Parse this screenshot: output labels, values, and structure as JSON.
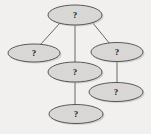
{
  "diagram": {
    "type": "node-link-graph",
    "title": "",
    "background_color": "#f2f1f0",
    "node_fill_color": "#d9d8d6",
    "node_stroke_color": "#4a4a4a",
    "edge_color": "#5a5a5a",
    "label_color": "#1d1d1d",
    "nodes": [
      {
        "id": "root",
        "label": "?",
        "cx": 75,
        "cy": 15,
        "rx": 27,
        "ry": 10
      },
      {
        "id": "left",
        "label": "?",
        "cx": 34,
        "cy": 53,
        "rx": 26,
        "ry": 9
      },
      {
        "id": "right",
        "label": "?",
        "cx": 117,
        "cy": 52,
        "rx": 26,
        "ry": 9.5
      },
      {
        "id": "middle",
        "label": "?",
        "cx": 75,
        "cy": 72,
        "rx": 27,
        "ry": 10
      },
      {
        "id": "lower-right",
        "label": "?",
        "cx": 116,
        "cy": 92,
        "rx": 27,
        "ry": 9.5
      },
      {
        "id": "bottom",
        "label": "?",
        "cx": 76,
        "cy": 114,
        "rx": 27,
        "ry": 9.5
      }
    ],
    "edges": [
      {
        "from": "root",
        "to": "left",
        "x1": 60,
        "y1": 23,
        "x2": 40,
        "y2": 45
      },
      {
        "from": "root",
        "to": "right",
        "x1": 92,
        "y1": 22,
        "x2": 110,
        "y2": 44
      },
      {
        "from": "root",
        "to": "middle",
        "x1": 75,
        "y1": 25,
        "x2": 75,
        "y2": 62
      },
      {
        "from": "right",
        "to": "lower-right",
        "x1": 117,
        "y1": 61,
        "x2": 117,
        "y2": 83
      },
      {
        "from": "middle",
        "to": "bottom",
        "x1": 75,
        "y1": 82,
        "x2": 75,
        "y2": 105
      }
    ]
  }
}
